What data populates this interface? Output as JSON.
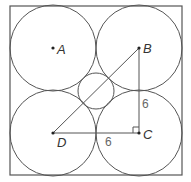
{
  "diagram": {
    "type": "geometry",
    "square": {
      "x": 10,
      "y": 6,
      "size": 172
    },
    "large_radius": 43,
    "small_circle": {
      "cx": 96,
      "cy": 91,
      "r": 18
    },
    "points": {
      "A": {
        "label": "A",
        "x": 53,
        "y": 48
      },
      "B": {
        "label": "B",
        "x": 139,
        "y": 48
      },
      "C": {
        "label": "C",
        "x": 139,
        "y": 133
      },
      "D": {
        "label": "D",
        "x": 53,
        "y": 133
      }
    },
    "measurements": {
      "BC": "6",
      "DC": "6"
    },
    "right_angle_at": "C"
  }
}
